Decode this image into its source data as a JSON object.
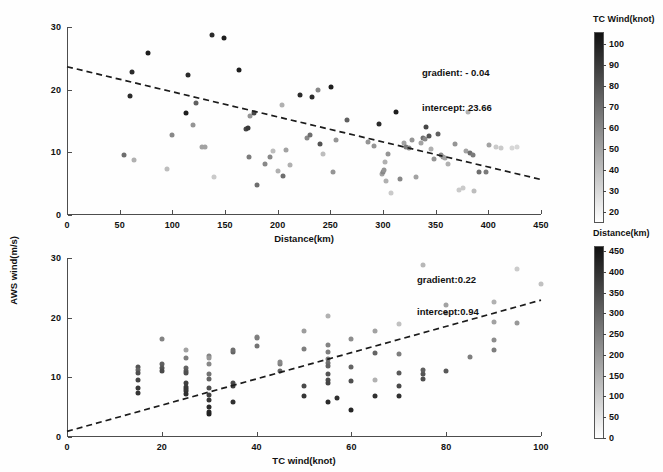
{
  "figure": {
    "shared_ylabel": "AWS wind(m/s)"
  },
  "panels": [
    {
      "id": "top",
      "xlabel": "Distance(km)",
      "ylabel": "AWS wind(m/s)",
      "xticks": [
        0,
        50,
        100,
        150,
        200,
        250,
        300,
        350,
        400,
        450
      ],
      "yticks": [
        0,
        10,
        20,
        30
      ],
      "xlim": [
        0,
        450
      ],
      "ylim": [
        0,
        30
      ],
      "annotations": [
        "gradient: - 0.04",
        "intercept: 23.66"
      ],
      "gradient": -0.04,
      "intercept": 23.66,
      "colorbar": {
        "title": "TC Wind(knot)",
        "ticks": [
          20,
          30,
          40,
          50,
          60,
          70,
          80,
          90,
          100
        ],
        "min": 15,
        "max": 105,
        "dark_end": "high"
      }
    },
    {
      "id": "bottom",
      "xlabel": "TC wind(knot)",
      "ylabel": "AWS wind(m/s)",
      "xticks": [
        0,
        20,
        40,
        60,
        80,
        100
      ],
      "yticks": [
        0,
        10,
        20,
        30
      ],
      "xlim": [
        0,
        100
      ],
      "ylim": [
        0,
        30
      ],
      "annotations": [
        "gradient:0.22",
        "intercept:0.94"
      ],
      "gradient": 0.22,
      "intercept": 0.94,
      "colorbar": {
        "title": "Distance(km)",
        "ticks": [
          0,
          50,
          100,
          150,
          200,
          250,
          300,
          350,
          400,
          450
        ],
        "min": 0,
        "max": 460,
        "dark_end": "high"
      }
    }
  ],
  "chart_data": [
    {
      "type": "scatter",
      "title": "",
      "xlabel": "Distance(km)",
      "ylabel": "AWS wind(m/s)",
      "xlim": [
        0,
        450
      ],
      "ylim": [
        0,
        30
      ],
      "grid": false,
      "legend": "none",
      "colorbar_label": "TC Wind(knot)",
      "colorbar_range": [
        15,
        105
      ],
      "trend_line": {
        "gradient": -0.04,
        "intercept": 23.66,
        "style": "dashed"
      },
      "points": [
        [
          54,
          9.5,
          70
        ],
        [
          60,
          19.0,
          95
        ],
        [
          62,
          22.8,
          95
        ],
        [
          64,
          8.7,
          45
        ],
        [
          77,
          25.8,
          100
        ],
        [
          95,
          7.4,
          40
        ],
        [
          100,
          12.8,
          60
        ],
        [
          113,
          16.2,
          100
        ],
        [
          115,
          22.4,
          95
        ],
        [
          120,
          14.4,
          55
        ],
        [
          122,
          17.8,
          75
        ],
        [
          128,
          10.8,
          50
        ],
        [
          131,
          10.9,
          50
        ],
        [
          138,
          28.8,
          95
        ],
        [
          140,
          6.0,
          35
        ],
        [
          149,
          28.3,
          100
        ],
        [
          163,
          23.2,
          100
        ],
        [
          170,
          13.8,
          85
        ],
        [
          172,
          13.9,
          90
        ],
        [
          173,
          9.3,
          65
        ],
        [
          174,
          15.8,
          55
        ],
        [
          178,
          16.3,
          85
        ],
        [
          180,
          4.8,
          70
        ],
        [
          188,
          8.1,
          60
        ],
        [
          193,
          9.2,
          60
        ],
        [
          196,
          10.2,
          40
        ],
        [
          200,
          7.0,
          45
        ],
        [
          204,
          17.5,
          45
        ],
        [
          205,
          6.3,
          70
        ],
        [
          208,
          10.4,
          50
        ],
        [
          212,
          7.9,
          45
        ],
        [
          221,
          19.1,
          95
        ],
        [
          228,
          12.3,
          60
        ],
        [
          231,
          12.8,
          70
        ],
        [
          233,
          18.8,
          95
        ],
        [
          238,
          20.0,
          60
        ],
        [
          240,
          11.3,
          80
        ],
        [
          243,
          9.8,
          40
        ],
        [
          251,
          20.5,
          100
        ],
        [
          253,
          6.8,
          55
        ],
        [
          255,
          11.9,
          55
        ],
        [
          266,
          15.2,
          75
        ],
        [
          286,
          11.7,
          55
        ],
        [
          291,
          11.0,
          55
        ],
        [
          296,
          14.6,
          95
        ],
        [
          299,
          6.6,
          50
        ],
        [
          300,
          6.9,
          60
        ],
        [
          301,
          7.2,
          55
        ],
        [
          302,
          8.5,
          45
        ],
        [
          303,
          5.5,
          45
        ],
        [
          305,
          9.8,
          55
        ],
        [
          308,
          3.5,
          35
        ],
        [
          312,
          16.5,
          100
        ],
        [
          316,
          5.7,
          60
        ],
        [
          320,
          11.5,
          50
        ],
        [
          322,
          10.9,
          65
        ],
        [
          325,
          10.7,
          60
        ],
        [
          328,
          12.0,
          55
        ],
        [
          331,
          6.1,
          50
        ],
        [
          336,
          11.5,
          50
        ],
        [
          338,
          12.3,
          70
        ],
        [
          340,
          12.1,
          60
        ],
        [
          341,
          14.0,
          85
        ],
        [
          344,
          12.6,
          80
        ],
        [
          346,
          10.5,
          45
        ],
        [
          348,
          9.0,
          55
        ],
        [
          352,
          13.0,
          75
        ],
        [
          355,
          9.6,
          60
        ],
        [
          357,
          9.3,
          55
        ],
        [
          359,
          9.1,
          50
        ],
        [
          362,
          8.1,
          45
        ],
        [
          368,
          11.4,
          55
        ],
        [
          372,
          4.0,
          35
        ],
        [
          376,
          4.3,
          35
        ],
        [
          379,
          10.2,
          50
        ],
        [
          381,
          16.5,
          45
        ],
        [
          383,
          9.9,
          70
        ],
        [
          385,
          9.6,
          65
        ],
        [
          386,
          3.9,
          40
        ],
        [
          391,
          6.8,
          70
        ],
        [
          398,
          6.8,
          65
        ],
        [
          401,
          11.2,
          50
        ],
        [
          407,
          10.8,
          35
        ],
        [
          412,
          10.7,
          35
        ],
        [
          422,
          10.7,
          30
        ],
        [
          427,
          10.8,
          30
        ]
      ]
    },
    {
      "type": "scatter",
      "title": "",
      "xlabel": "TC wind(knot)",
      "ylabel": "AWS wind(m/s)",
      "xlim": [
        0,
        100
      ],
      "ylim": [
        0,
        30
      ],
      "grid": false,
      "legend": "none",
      "colorbar_label": "Distance(km)",
      "colorbar_range": [
        0,
        460
      ],
      "trend_line": {
        "gradient": 0.22,
        "intercept": 0.94,
        "style": "dashed"
      },
      "points": [
        [
          15,
          11.8,
          330
        ],
        [
          15,
          11.2,
          300
        ],
        [
          15,
          10.8,
          340
        ],
        [
          15,
          9.6,
          360
        ],
        [
          15,
          8.2,
          380
        ],
        [
          15,
          7.4,
          390
        ],
        [
          20,
          16.5,
          240
        ],
        [
          20,
          12.2,
          310
        ],
        [
          20,
          11.6,
          330
        ],
        [
          20,
          11.0,
          350
        ],
        [
          25,
          14.5,
          180
        ],
        [
          25,
          13.2,
          250
        ],
        [
          25,
          11.5,
          300
        ],
        [
          25,
          11.0,
          320
        ],
        [
          25,
          10.7,
          340
        ],
        [
          25,
          9.0,
          370
        ],
        [
          25,
          8.3,
          380
        ],
        [
          25,
          7.7,
          390
        ],
        [
          25,
          7.2,
          400
        ],
        [
          25,
          8.0,
          385
        ],
        [
          30,
          13.6,
          240
        ],
        [
          30,
          13.2,
          200
        ],
        [
          30,
          12.2,
          230
        ],
        [
          30,
          10.6,
          270
        ],
        [
          30,
          9.8,
          300
        ],
        [
          30,
          8.2,
          340
        ],
        [
          30,
          7.0,
          370
        ],
        [
          30,
          6.2,
          390
        ],
        [
          30,
          5.0,
          410
        ],
        [
          30,
          4.2,
          420
        ],
        [
          30,
          3.8,
          430
        ],
        [
          35,
          14.2,
          300
        ],
        [
          35,
          14.6,
          280
        ],
        [
          35,
          9.0,
          350
        ],
        [
          35,
          8.6,
          370
        ],
        [
          35,
          5.8,
          400
        ],
        [
          40,
          16.8,
          230
        ],
        [
          40,
          16.6,
          250
        ],
        [
          40,
          15.3,
          270
        ],
        [
          45,
          11.1,
          300
        ],
        [
          45,
          12.3,
          250
        ],
        [
          45,
          12.6,
          230
        ],
        [
          50,
          17.8,
          190
        ],
        [
          50,
          14.8,
          250
        ],
        [
          50,
          8.5,
          350
        ],
        [
          50,
          6.8,
          390
        ],
        [
          55,
          20.3,
          150
        ],
        [
          55,
          15.4,
          240
        ],
        [
          55,
          14.2,
          250
        ],
        [
          55,
          13.0,
          260
        ],
        [
          55,
          12.4,
          280
        ],
        [
          55,
          11.9,
          300
        ],
        [
          55,
          10.5,
          330
        ],
        [
          55,
          9.6,
          350
        ],
        [
          55,
          9.0,
          360
        ],
        [
          55,
          5.8,
          410
        ],
        [
          57,
          6.6,
          400
        ],
        [
          60,
          16.4,
          220
        ],
        [
          60,
          11.7,
          300
        ],
        [
          60,
          9.4,
          340
        ],
        [
          60,
          4.5,
          420
        ],
        [
          65,
          17.8,
          180
        ],
        [
          65,
          9.5,
          150
        ],
        [
          65,
          6.8,
          400
        ],
        [
          65,
          14.0,
          300
        ],
        [
          70,
          19.0,
          120
        ],
        [
          70,
          13.9,
          250
        ],
        [
          70,
          10.7,
          320
        ],
        [
          70,
          8.6,
          350
        ],
        [
          70,
          6.8,
          400
        ],
        [
          75,
          28.8,
          140
        ],
        [
          75,
          10.5,
          330
        ],
        [
          75,
          9.8,
          340
        ],
        [
          75,
          11.2,
          310
        ],
        [
          80,
          22.2,
          180
        ],
        [
          80,
          20.7,
          200
        ],
        [
          80,
          11.1,
          320
        ],
        [
          85,
          13.4,
          250
        ],
        [
          90,
          22.6,
          150
        ],
        [
          90,
          19.3,
          180
        ],
        [
          90,
          16.2,
          220
        ],
        [
          90,
          14.5,
          250
        ],
        [
          95,
          28.1,
          100
        ],
        [
          95,
          19.1,
          200
        ],
        [
          100,
          25.6,
          120
        ]
      ]
    }
  ]
}
